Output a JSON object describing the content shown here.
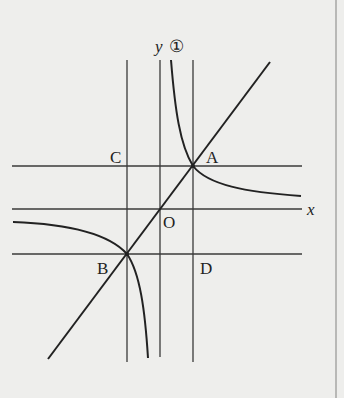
{
  "figure": {
    "labels": {
      "y_axis": "y",
      "x_axis": "x",
      "origin": "O",
      "curve": "①",
      "point_a": "A",
      "point_b": "B",
      "point_c": "C",
      "point_d": "D"
    },
    "colors": {
      "background": "#eeeeec",
      "line": "#2a2a2a",
      "border": "#b8b8b6"
    },
    "elements": {
      "vertical_lines": [
        "x = x_B (through C and B)",
        "y-axis",
        "x = x_A (through A and D)"
      ],
      "horizontal_lines": [
        "y = y_A (through C and A)",
        "x-axis",
        "y = y_B (through B and D)"
      ],
      "straight_line": "through B, O, A",
      "curve_1": "hyperbola branches through A and B"
    }
  }
}
